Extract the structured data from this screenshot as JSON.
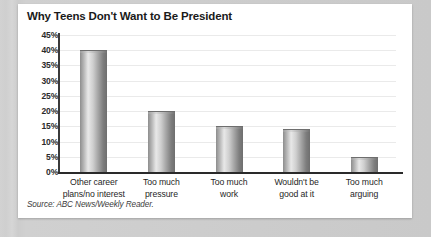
{
  "chart_data": {
    "type": "bar",
    "title": "Why Teens Don't Want to Be President",
    "categories": [
      "Other career plans/no interest",
      "Too much pressure",
      "Too much work",
      "Wouldn't be good at it",
      "Too much arguing"
    ],
    "category_lines": [
      [
        "Other career",
        "plans/no interest"
      ],
      [
        "Too much",
        "pressure"
      ],
      [
        "Too much",
        "work"
      ],
      [
        "Wouldn't be",
        "good at it"
      ],
      [
        "Too much",
        "arguing"
      ]
    ],
    "values": [
      40,
      20,
      15,
      14,
      5
    ],
    "xlabel": "",
    "ylabel": "",
    "ylim": [
      0,
      45
    ],
    "ytick_step": 5,
    "ytick_labels": [
      "45%",
      "40%",
      "35%",
      "30%",
      "25%",
      "20%",
      "15%",
      "10%",
      "5%",
      "0%"
    ],
    "ytick_values": [
      45,
      40,
      35,
      30,
      25,
      20,
      15,
      10,
      5,
      0
    ],
    "grid": true,
    "legend": null,
    "value_suffix": "%"
  },
  "source": {
    "prefix": "Source: ABC News/",
    "italic_part": "Weekly Reader",
    "suffix": ".",
    "full": "Source: ABC News/Weekly Reader."
  },
  "colors": {
    "background": "#c9c9c9",
    "card": "#ffffff",
    "axis": "#2a2a2a",
    "gridline": "#eaeaea",
    "bar_light": "#e8e8e8",
    "bar_dark": "#6e6e6e",
    "text": "#1a1a1a"
  }
}
